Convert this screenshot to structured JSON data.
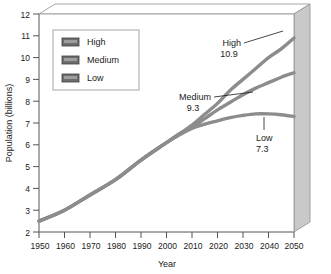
{
  "chart_data": {
    "type": "line",
    "title": "",
    "xlabel": "Year",
    "ylabel": "Population (billions)",
    "xlim": [
      1950,
      2050
    ],
    "ylim": [
      2,
      12
    ],
    "xticks": [
      1950,
      1960,
      1970,
      1980,
      1990,
      2000,
      2010,
      2020,
      2030,
      2040,
      2050
    ],
    "yticks": [
      2,
      3,
      4,
      5,
      6,
      7,
      8,
      9,
      10,
      11,
      12
    ],
    "xtick_labels": [
      "1950",
      "1960",
      "1970",
      "1980",
      "1990",
      "2000",
      "2010",
      "2020",
      "2030",
      "2040",
      "2050"
    ],
    "ytick_labels": [
      "2",
      "3",
      "4",
      "5",
      "6",
      "7",
      "8",
      "9",
      "10",
      "11",
      "12"
    ],
    "grid": false,
    "legend_position": "upper-left",
    "x": [
      1950,
      1960,
      1970,
      1980,
      1990,
      2000,
      2005,
      2010,
      2015,
      2020,
      2025,
      2030,
      2035,
      2040,
      2045,
      2050
    ],
    "series": [
      {
        "name": "High",
        "values": [
          2.5,
          3.0,
          3.7,
          4.4,
          5.3,
          6.1,
          6.5,
          6.9,
          7.4,
          7.9,
          8.5,
          9.0,
          9.5,
          10.0,
          10.4,
          10.9
        ],
        "color": "#8c8c8c",
        "end_value": 10.9
      },
      {
        "name": "Medium",
        "values": [
          2.5,
          3.0,
          3.7,
          4.4,
          5.3,
          6.1,
          6.5,
          6.8,
          7.2,
          7.6,
          7.95,
          8.3,
          8.6,
          8.85,
          9.1,
          9.3
        ],
        "color": "#8c8c8c",
        "end_value": 9.3
      },
      {
        "name": "Low",
        "values": [
          2.5,
          3.0,
          3.7,
          4.4,
          5.3,
          6.1,
          6.45,
          6.75,
          6.95,
          7.1,
          7.25,
          7.35,
          7.42,
          7.42,
          7.38,
          7.3
        ],
        "color": "#8c8c8c",
        "end_value": 7.3
      }
    ],
    "annotations": [
      {
        "name": "High",
        "label": "High",
        "value": "10.9"
      },
      {
        "name": "Medium",
        "label": "Medium",
        "value": "9.3"
      },
      {
        "name": "Low",
        "label": "Low",
        "value": "7.3"
      }
    ]
  },
  "legend": {
    "items": [
      {
        "label": "High",
        "color": "#6e6e6e"
      },
      {
        "label": "Medium",
        "color": "#6e6e6e"
      },
      {
        "label": "Low",
        "color": "#6e6e6e"
      }
    ]
  },
  "colors": {
    "line": "#8c8c8c",
    "axis": "#555555",
    "panel_side": "#c9c9c9",
    "panel_top": "#ffffff",
    "text": "#1a1a1a",
    "background": "#ffffff"
  }
}
